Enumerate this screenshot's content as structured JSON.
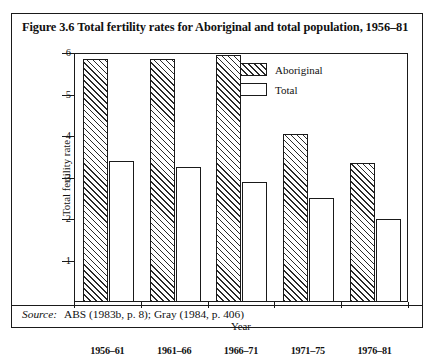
{
  "figure": {
    "title": "Figure 3.6  Total fertility rates for Aboriginal and total population, 1956–81",
    "source_label": "Source:",
    "source_text": "ABS (1983b, p. 8); Gray (1984, p. 406)"
  },
  "chart_data": {
    "type": "bar",
    "title": "Figure 3.6  Total fertility rates for Aboriginal and total population, 1956–81",
    "xlabel": "Year",
    "ylabel": "Total fertility rate",
    "categories": [
      "1956–61",
      "1961–66",
      "1966–71",
      "1971–75",
      "1976–81"
    ],
    "series": [
      {
        "name": "Aboriginal",
        "values": [
          5.85,
          5.85,
          5.95,
          4.05,
          3.35
        ],
        "fill": "hatched"
      },
      {
        "name": "Total",
        "values": [
          3.4,
          3.25,
          2.9,
          2.5,
          2.0
        ],
        "fill": "white"
      }
    ],
    "ylim": [
      0,
      6
    ],
    "yticks": [
      1,
      2,
      3,
      4,
      5,
      6
    ],
    "grid": false,
    "legend_position": "top-center",
    "colors": {
      "line": "#1a1a1a",
      "background": "#ffffff"
    }
  }
}
